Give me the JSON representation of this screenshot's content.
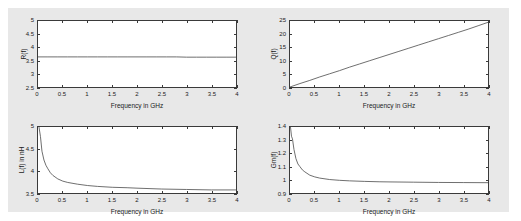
{
  "figure": {
    "background_color": "#e8e8e8",
    "axes_color": "#3a3a3a",
    "line_color": "#4a4a4a"
  },
  "chart_data": [
    {
      "id": "resistance",
      "type": "line",
      "title": "",
      "xlabel": "Frequency in GHz",
      "ylabel": "R(f)",
      "xlim": [
        0,
        4
      ],
      "ylim": [
        2.5,
        5
      ],
      "xticks": [
        0,
        0.5,
        1,
        1.5,
        2,
        2.5,
        3,
        3.5,
        4
      ],
      "xticklabels": [
        "0",
        "0.5",
        "1",
        "1.5",
        "2",
        "2.5",
        "3",
        "3.5",
        "4"
      ],
      "yticks": [
        2.5,
        3,
        3.5,
        4,
        4.5,
        5
      ],
      "yticklabels": [
        "2.5",
        "3",
        "3.5",
        "4",
        "4.5",
        "5"
      ],
      "grid": false,
      "legend": "none",
      "x": [
        0,
        0.2,
        0.4,
        0.6,
        0.8,
        1.0,
        1.2,
        1.4,
        1.6,
        1.8,
        2.0,
        2.2,
        2.4,
        2.6,
        2.8,
        3.0,
        3.2,
        3.4,
        3.6,
        3.8,
        4.0
      ],
      "y": [
        3.64,
        3.64,
        3.64,
        3.64,
        3.64,
        3.64,
        3.64,
        3.64,
        3.64,
        3.64,
        3.64,
        3.64,
        3.64,
        3.64,
        3.64,
        3.63,
        3.63,
        3.63,
        3.63,
        3.63,
        3.63
      ]
    },
    {
      "id": "quality-factor",
      "type": "line",
      "title": "",
      "xlabel": "Frequency in GHz",
      "ylabel": "Q(f)",
      "xlim": [
        0,
        4
      ],
      "ylim": [
        0,
        25
      ],
      "xticks": [
        0,
        0.5,
        1,
        1.5,
        2,
        2.5,
        3,
        3.5,
        4
      ],
      "xticklabels": [
        "0",
        "0.5",
        "1",
        "1.5",
        "2",
        "2.5",
        "3",
        "3.5",
        "4"
      ],
      "yticks": [
        0,
        5,
        10,
        15,
        20,
        25
      ],
      "yticklabels": [
        "0",
        "5",
        "10",
        "15",
        "20",
        "25"
      ],
      "grid": false,
      "legend": "none",
      "x": [
        0,
        0.2,
        0.4,
        0.6,
        0.8,
        1.0,
        1.2,
        1.4,
        1.6,
        1.8,
        2.0,
        2.2,
        2.4,
        2.6,
        2.8,
        3.0,
        3.2,
        3.4,
        3.6,
        3.8,
        4.0
      ],
      "y": [
        0,
        1.3,
        2.5,
        3.8,
        5.0,
        6.2,
        7.5,
        8.7,
        9.9,
        11.1,
        12.3,
        13.5,
        14.7,
        15.9,
        17.1,
        18.3,
        19.5,
        20.7,
        21.9,
        23.2,
        24.5
      ]
    },
    {
      "id": "inductance",
      "type": "line",
      "title": "",
      "xlabel": "Frequency in GHz",
      "ylabel": "L(f) in nH",
      "xlim": [
        0,
        4
      ],
      "ylim": [
        3.5,
        5
      ],
      "xticks": [
        0,
        0.5,
        1,
        1.5,
        2,
        2.5,
        3,
        3.5,
        4
      ],
      "xticklabels": [
        "0",
        "0.5",
        "1",
        "1.5",
        "2",
        "2.5",
        "3",
        "3.5",
        "4"
      ],
      "yticks": [
        3.5,
        4,
        4.5,
        5
      ],
      "yticklabels": [
        "3.5",
        "4",
        "4.5",
        "5"
      ],
      "grid": false,
      "legend": "none",
      "x": [
        0.02,
        0.05,
        0.08,
        0.12,
        0.16,
        0.2,
        0.25,
        0.3,
        0.4,
        0.5,
        0.6,
        0.8,
        1.0,
        1.2,
        1.5,
        1.8,
        2.0,
        2.5,
        3.0,
        3.5,
        4.0
      ],
      "y": [
        5.0,
        4.78,
        4.45,
        4.25,
        4.13,
        4.05,
        3.96,
        3.9,
        3.82,
        3.77,
        3.74,
        3.7,
        3.67,
        3.65,
        3.63,
        3.62,
        3.61,
        3.59,
        3.58,
        3.57,
        3.57
      ]
    },
    {
      "id": "gain",
      "type": "line",
      "title": "",
      "xlabel": "Frequency in GHz",
      "ylabel": "Gm(f)",
      "xlim": [
        0,
        4
      ],
      "ylim": [
        0.9,
        1.4
      ],
      "xticks": [
        0,
        0.5,
        1,
        1.5,
        2,
        2.5,
        3,
        3.5,
        4
      ],
      "xticklabels": [
        "0",
        "0.5",
        "1",
        "1.5",
        "2",
        "2.5",
        "3",
        "3.5",
        "4"
      ],
      "yticks": [
        0.9,
        1.0,
        1.1,
        1.2,
        1.3,
        1.4
      ],
      "yticklabels": [
        "0.9",
        "1",
        "1.1",
        "1.2",
        "1.3",
        "1.4"
      ],
      "grid": false,
      "legend": "none",
      "x": [
        0.01,
        0.03,
        0.05,
        0.08,
        0.12,
        0.16,
        0.2,
        0.25,
        0.3,
        0.4,
        0.5,
        0.6,
        0.8,
        1.0,
        1.2,
        1.5,
        1.8,
        2.0,
        2.5,
        3.0,
        3.5,
        4.0
      ],
      "y": [
        1.4,
        1.33,
        1.31,
        1.23,
        1.16,
        1.12,
        1.1,
        1.075,
        1.06,
        1.035,
        1.022,
        1.013,
        1.002,
        0.996,
        0.992,
        0.988,
        0.985,
        0.984,
        0.982,
        0.98,
        0.979,
        0.978
      ]
    }
  ]
}
